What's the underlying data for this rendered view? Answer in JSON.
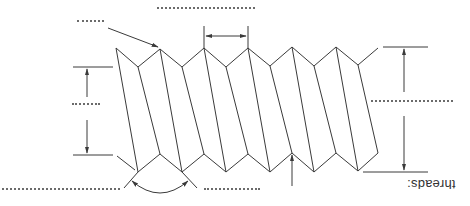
{
  "diagram": {
    "type": "screw-thread-nomenclature",
    "orientation": "rotated-180",
    "caption": "threads:",
    "colors": {
      "line": "#3a3a3a",
      "blank": "#6b6b6b",
      "background": "#ffffff"
    },
    "labels": [
      {
        "id": "pitch-label",
        "text": "",
        "left": 157,
        "top": 4,
        "width": 98
      },
      {
        "id": "crest-label",
        "text": "",
        "left": 77,
        "top": 11,
        "width": 27
      },
      {
        "id": "minor-diameter-label",
        "text": "",
        "left": 72,
        "top": 94,
        "width": 28
      },
      {
        "id": "major-diameter-label",
        "text": "",
        "left": 371,
        "top": 91,
        "width": 82
      },
      {
        "id": "thread-angle-label",
        "text": "",
        "left": 2,
        "top": 179,
        "width": 118
      },
      {
        "id": "root-label",
        "text": "",
        "left": 204,
        "top": 179,
        "width": 56
      }
    ],
    "thread_profile": {
      "top": [
        [
          116,
          48
        ],
        [
          138,
          67
        ],
        [
          160,
          49
        ],
        [
          182,
          67
        ],
        [
          204,
          48
        ],
        [
          226,
          67
        ],
        [
          248,
          48
        ],
        [
          270,
          66
        ],
        [
          292,
          47
        ],
        [
          314,
          66
        ],
        [
          336,
          47
        ],
        [
          358,
          65
        ],
        [
          378,
          48
        ]
      ],
      "bottom": [
        [
          138,
          172
        ],
        [
          160,
          154
        ],
        [
          182,
          172
        ],
        [
          204,
          154
        ],
        [
          226,
          172
        ],
        [
          248,
          154
        ],
        [
          270,
          172
        ],
        [
          292,
          153
        ],
        [
          314,
          172
        ],
        [
          336,
          153
        ],
        [
          358,
          171
        ],
        [
          378,
          153
        ]
      ],
      "flank_lines": [
        [
          [
            116,
            48
          ],
          [
            138,
            172
          ]
        ],
        [
          [
            138,
            67
          ],
          [
            160,
            154
          ]
        ],
        [
          [
            160,
            49
          ],
          [
            182,
            172
          ]
        ],
        [
          [
            182,
            67
          ],
          [
            204,
            154
          ]
        ],
        [
          [
            204,
            48
          ],
          [
            226,
            172
          ]
        ],
        [
          [
            226,
            67
          ],
          [
            248,
            154
          ]
        ],
        [
          [
            248,
            48
          ],
          [
            270,
            172
          ]
        ],
        [
          [
            270,
            66
          ],
          [
            292,
            153
          ]
        ],
        [
          [
            292,
            47
          ],
          [
            314,
            172
          ]
        ],
        [
          [
            314,
            66
          ],
          [
            336,
            153
          ]
        ],
        [
          [
            336,
            47
          ],
          [
            358,
            171
          ]
        ],
        [
          [
            358,
            65
          ],
          [
            378,
            153
          ]
        ]
      ]
    },
    "dimensions": {
      "pitch": {
        "x1": 204,
        "x2": 248,
        "y": 36
      },
      "minor_diameter": {
        "x": 87,
        "y_top": 67,
        "y_bottom": 155
      },
      "major_diameter": {
        "x": 404,
        "y_top": 47,
        "y_bottom": 172
      },
      "thread_angle_arc": {
        "cx": 160,
        "cy": 154,
        "r": 40
      }
    }
  }
}
